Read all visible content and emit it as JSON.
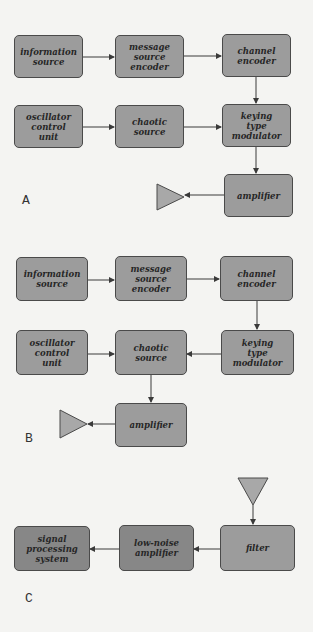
{
  "colors": {
    "box_fill": "#9c9c9c",
    "box_fill_dark": "#878787",
    "box_border": "#4a4a4a",
    "text": "#262626",
    "antenna_fill": "#a8a8a8",
    "line": "#3a3a3a"
  },
  "panels": {
    "a": {
      "label": "A",
      "blocks": {
        "information_source": "information\nsource",
        "message_source_encoder": "message\nsource\nencoder",
        "channel_encoder": "channel\nencoder",
        "oscillator_control_unit": "oscillator\ncontrol\nunit",
        "chaotic_source": "chaotic\nsource",
        "keying_type_modulator": "keying\ntype\nmodulator",
        "amplifier": "amplifier"
      },
      "antenna": "transmit-antenna-icon"
    },
    "b": {
      "label": "B",
      "blocks": {
        "information_source": "information\nsource",
        "message_source_encoder": "message\nsource\nencoder",
        "channel_encoder": "channel\nencoder",
        "oscillator_control_unit": "oscillator\ncontrol\nunit",
        "chaotic_source": "chaotic\nsource",
        "keying_type_modulator": "keying\ntype\nmodulator",
        "amplifier": "amplifier"
      },
      "antenna": "transmit-antenna-icon"
    },
    "c": {
      "label": "C",
      "blocks": {
        "signal_processing_system": "signal\nprocessing\nsystem",
        "low_noise_amplifier": "low-noise\namplifier",
        "filter": "filter"
      },
      "antenna": "receive-antenna-icon"
    }
  }
}
